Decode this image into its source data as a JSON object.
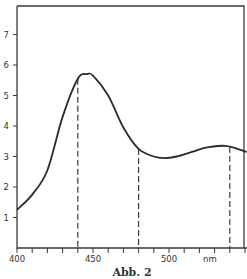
{
  "chart_data": {
    "type": "line",
    "title": "",
    "caption": "Abb. 2",
    "xlabel": "nm",
    "ylabel": "",
    "xlim": [
      400,
      551
    ],
    "ylim": [
      0,
      7.9
    ],
    "grid": false,
    "legend": null,
    "x_ticks": [
      400,
      450,
      500
    ],
    "x_tick_labels": [
      "400",
      "450",
      "500"
    ],
    "x_minor_tick_step": 10,
    "y_ticks": [
      1,
      2,
      3,
      4,
      5,
      6,
      7
    ],
    "y_tick_labels": [
      "1",
      "2",
      "3",
      "4",
      "5",
      "6",
      "7"
    ],
    "series": [
      {
        "name": "absorption",
        "x": [
          400,
          410,
          420,
          430,
          440,
          446,
          450,
          460,
          470,
          480,
          490,
          497,
          505,
          515,
          525,
          537,
          545,
          551
        ],
        "y": [
          1.25,
          1.75,
          2.55,
          4.3,
          5.55,
          5.7,
          5.65,
          5.0,
          3.95,
          3.25,
          3.0,
          2.95,
          3.0,
          3.15,
          3.3,
          3.35,
          3.25,
          3.15
        ]
      }
    ],
    "annotations": [
      {
        "type": "vline-dashed",
        "x": 440
      },
      {
        "type": "vline-dashed",
        "x": 480
      },
      {
        "type": "vline-dashed",
        "x": 540
      }
    ]
  },
  "labels": {
    "x_unit": "nm",
    "caption": "Abb. 2"
  }
}
